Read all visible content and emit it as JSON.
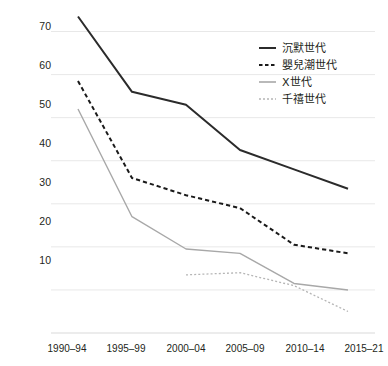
{
  "chart_data": {
    "type": "line",
    "title": "",
    "subtitle": "",
    "xlabel": "",
    "ylabel": "",
    "categories": [
      "1990–94",
      "1995–99",
      "2000–04",
      "2005–09",
      "2010–14",
      "2015–21"
    ],
    "ylim": [
      0,
      75
    ],
    "yticks": [
      10,
      20,
      30,
      40,
      50,
      60,
      70
    ],
    "ytick_labels": [
      "10",
      "20",
      "30",
      "40",
      "50",
      "60",
      "70"
    ],
    "grid": true,
    "grid_axis": "y",
    "legend_position": "top-right",
    "series": [
      {
        "name": "沉默世代",
        "style": "solid",
        "color": "#2b2b2b",
        "width": 2.0,
        "values": [
          73.5,
          56,
          53,
          42.5,
          38,
          33.5
        ]
      },
      {
        "name": "嬰兒潮世代",
        "style": "dashed",
        "color": "#1a1a1a",
        "width": 2.0,
        "values": [
          58.5,
          36,
          32,
          29,
          20.5,
          18.5
        ]
      },
      {
        "name": "X世代",
        "style": "solid",
        "color": "#a8a8a8",
        "width": 1.4,
        "values": [
          52,
          27,
          19.5,
          18.5,
          11.5,
          10
        ]
      },
      {
        "name": "千禧世代",
        "style": "dotted",
        "color": "#b5b5b5",
        "width": 1.3,
        "values": [
          null,
          null,
          13.5,
          14,
          11,
          5
        ]
      }
    ]
  },
  "colors": {
    "background": "#ffffff",
    "grid": "#e8e8e8",
    "axis_text": "#231f20",
    "silent": "#2b2b2b",
    "boomer": "#1a1a1a",
    "genx": "#a8a8a8",
    "millennial": "#b5b5b5"
  }
}
